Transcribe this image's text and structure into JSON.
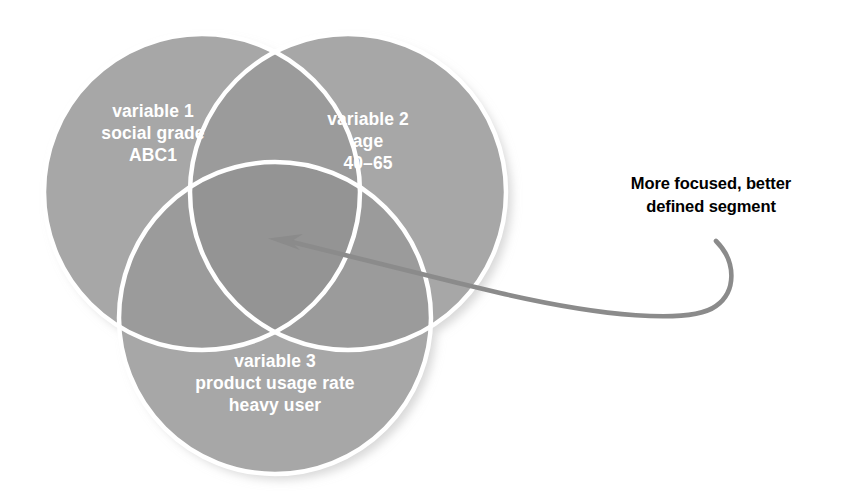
{
  "figure": {
    "type": "venn-diagram",
    "set_count": 3,
    "background_color": "#ffffff",
    "circle_fill": "#a7a7a7",
    "circle_overlap_fill": "#9b9b9b",
    "circle_center_fill": "#949494",
    "circle_outline": "#ffffff",
    "arrow_color": "#8b8b8b",
    "label_color": "#ffffff",
    "callout_color": "#000000"
  },
  "circles": [
    {
      "id": "variable-1",
      "title": "variable 1",
      "lines": [
        "variable 1",
        "social grade",
        "ABC1"
      ],
      "cx": 202,
      "cy": 192,
      "r": 158
    },
    {
      "id": "variable-2",
      "title": "variable 2",
      "lines": [
        "variable 2",
        "age",
        "40–65"
      ],
      "cx": 348,
      "cy": 192,
      "r": 158
    },
    {
      "id": "variable-3",
      "title": "variable 3",
      "lines": [
        "variable 3",
        "product usage rate",
        "heavy user"
      ],
      "cx": 275,
      "cy": 318,
      "r": 156
    }
  ],
  "labels": {
    "variable1": {
      "line1": "variable 1",
      "line2": "social grade",
      "line3": "ABC1"
    },
    "variable2": {
      "line1": "variable 2",
      "line2": "age",
      "line3": "40–65"
    },
    "variable3": {
      "line1": "variable 3",
      "line2": "product usage rate",
      "line3": "heavy user"
    }
  },
  "callout": {
    "line1": "More focused, better",
    "line2": "defined segment",
    "arrow_points_to": "center-intersection",
    "arrow_tip": {
      "x": 268,
      "y": 239
    }
  }
}
